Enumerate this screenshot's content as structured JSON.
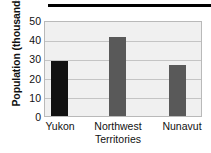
{
  "chart_data": {
    "type": "bar",
    "title": "",
    "subtitle": "",
    "xlabel": "",
    "ylabel": "Population (thousands)",
    "categories": [
      "Yukon",
      "Northwest Territories",
      "Nunavut"
    ],
    "values": [
      29,
      42,
      27
    ],
    "ylim": [
      0,
      50
    ],
    "yticks": [
      0,
      10,
      20,
      30,
      40,
      50
    ],
    "ytick_labels": [
      "0",
      "10",
      "20",
      "30",
      "40",
      "50"
    ],
    "grid": true,
    "grid_axis": "y",
    "legend": false,
    "legend_position": "none",
    "bar_colors": [
      "#111111",
      "#595959",
      "#595959"
    ],
    "plot_background": "#f0f0f0",
    "gridline_color": "#c4c4c4",
    "plot_border_color": "#b9b9b9",
    "annotations": []
  },
  "decor": {
    "top_rule_color": "#000000"
  },
  "axis": {
    "y_title": "Population (thousands)",
    "ytick_0": "0",
    "ytick_1": "10",
    "ytick_2": "20",
    "ytick_3": "30",
    "ytick_4": "40",
    "ytick_5": "50"
  },
  "categories": {
    "yukon_line1": "Yukon",
    "nwt_line1": "Northwest",
    "nwt_line2": "Territories",
    "nunavut_line1": "Nunavut"
  }
}
